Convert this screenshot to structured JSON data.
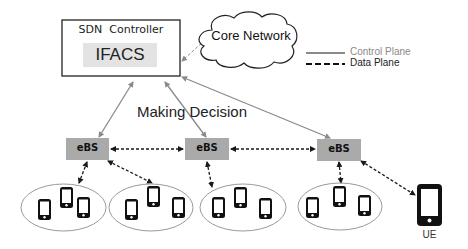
{
  "controller": {
    "title": "SDN  Controller",
    "module": "IFACS"
  },
  "cloud": {
    "label": "Core Network"
  },
  "legend": {
    "control_label": "Control Plane",
    "data_label": "Data Plane",
    "control_color": "#8a8a8a",
    "data_color": "#1a1a1a"
  },
  "annotation": {
    "decision": "Making Decision"
  },
  "base_stations": [
    {
      "label": "eBS"
    },
    {
      "label": "eBS"
    },
    {
      "label": "eBS"
    }
  ],
  "ue": {
    "label": "UE"
  },
  "colors": {
    "ebs_fill": "#aaaaaa",
    "ifacs_fill": "#e3e3e3",
    "line_gray": "#8a8a8a",
    "ellipse_stroke": "#9a9a9a"
  }
}
